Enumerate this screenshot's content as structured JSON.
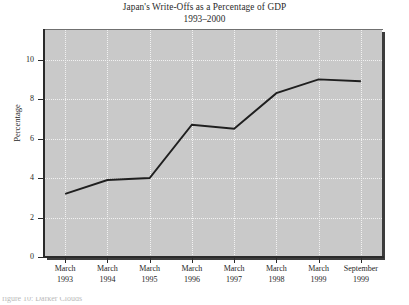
{
  "chart_data": {
    "type": "line",
    "title": "Japan's Write-Offs as a Percentage of GDP",
    "subtitle": "1993–2000",
    "xlabel": "",
    "ylabel": "Percentage",
    "categories": [
      "March 1993",
      "March 1994",
      "March 1995",
      "March 1996",
      "March 1997",
      "March 1998",
      "March 1999",
      "September 1999"
    ],
    "category_lines": [
      [
        "March",
        "1993"
      ],
      [
        "March",
        "1994"
      ],
      [
        "March",
        "1995"
      ],
      [
        "March",
        "1996"
      ],
      [
        "March",
        "1997"
      ],
      [
        "March",
        "1998"
      ],
      [
        "March",
        "1999"
      ],
      [
        "September",
        "1999"
      ]
    ],
    "values": [
      3.2,
      3.9,
      4.0,
      6.7,
      6.5,
      8.3,
      9.0,
      8.9
    ],
    "ylim": [
      0,
      11.5
    ],
    "yticks": [
      0,
      2,
      4,
      6,
      8,
      10
    ],
    "ytick_labels": [
      "0",
      "2",
      "4",
      "6",
      "8",
      "10"
    ],
    "grid": true,
    "grid_color": "#f2f2f2",
    "legend": null,
    "plot_background": "#c9c9c9",
    "line_color": "#1f1f1f",
    "series": [
      {
        "name": "Write-offs as % of GDP",
        "values": [
          3.2,
          3.9,
          4.0,
          6.7,
          6.5,
          8.3,
          9.0,
          8.9
        ]
      }
    ]
  },
  "caption": {
    "partial_text": "figure 10: Darker Clouds"
  }
}
